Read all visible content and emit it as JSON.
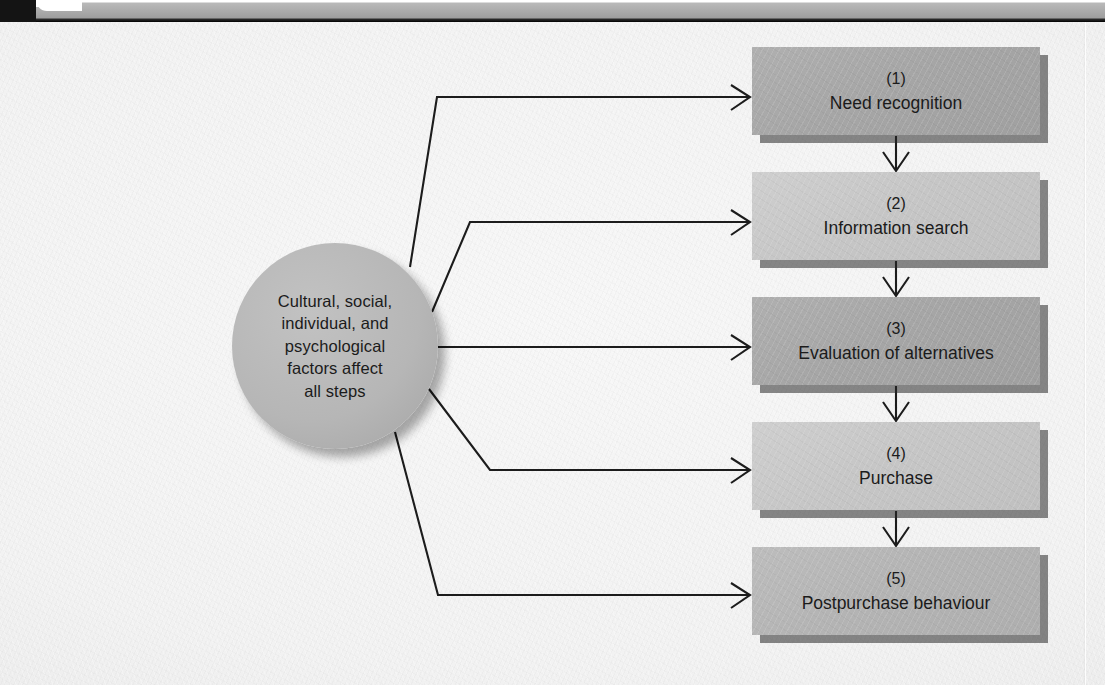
{
  "page": {
    "background_color": "#f2f2f2",
    "band_color": "#a9a9a9",
    "corner_color": "#141414"
  },
  "hub": {
    "text": "Cultural, social,\nindividual, and\npsychological\nfactors affect\nall steps",
    "fill_color": "#b6b6b6"
  },
  "steps": [
    {
      "number": "(1)",
      "title": "Need recognition",
      "tone": "dark",
      "fill_color": "#a6a6a6"
    },
    {
      "number": "(2)",
      "title": "Information search",
      "tone": "light",
      "fill_color": "#c6c6c6"
    },
    {
      "number": "(3)",
      "title": "Evaluation of alternatives",
      "tone": "dark",
      "fill_color": "#a6a6a6"
    },
    {
      "number": "(4)",
      "title": "Purchase",
      "tone": "light",
      "fill_color": "#c6c6c6"
    },
    {
      "number": "(5)",
      "title": "Postpurchase behaviour",
      "tone": "mid",
      "fill_color": "#b4b4b4"
    }
  ],
  "connectors": {
    "line_color": "#1c1c1c",
    "hub_to_steps": 5,
    "step_to_step_arrows": 4
  }
}
